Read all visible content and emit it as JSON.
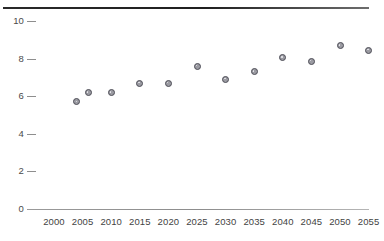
{
  "chart_data": {
    "type": "scatter",
    "title": "",
    "subtitle": "",
    "xlabel": "",
    "ylabel": "",
    "x": [
      2000,
      2005,
      2010,
      2015,
      2020,
      2025,
      2030,
      2035,
      2040,
      2045,
      2050,
      2055
    ],
    "categories": [
      "2000",
      "2005",
      "2010",
      "2015",
      "2020",
      "2025",
      "2030",
      "2035",
      "2040",
      "2045",
      "2050",
      "2055"
    ],
    "xlim": [
      2000,
      2055
    ],
    "ylim": [
      0,
      10
    ],
    "yticks": [
      0,
      2,
      4,
      6,
      8,
      10
    ],
    "ytick_labels": [
      "0",
      "2",
      "4",
      "6",
      "8",
      "10"
    ],
    "xticks": [
      2000,
      2005,
      2010,
      2015,
      2020,
      2025,
      2030,
      2035,
      2040,
      2045,
      2050,
      2055
    ],
    "xtick_labels": [
      "2000",
      "2005",
      "2010",
      "2015",
      "2020",
      "2025",
      "2030",
      "2035",
      "2040",
      "2045",
      "2050",
      "2055"
    ],
    "grid": false,
    "legend": false,
    "legend_position": "none",
    "series": [
      {
        "name": "series-1",
        "marker": "circle",
        "marker_fill": "#9b9ba2",
        "marker_edge": "#4e4e57",
        "points": [
          {
            "x": 2004,
            "y": 5.7
          },
          {
            "x": 2006,
            "y": 6.2
          },
          {
            "x": 2010,
            "y": 6.2
          },
          {
            "x": 2015,
            "y": 6.7
          },
          {
            "x": 2020,
            "y": 6.7
          },
          {
            "x": 2025,
            "y": 7.6
          },
          {
            "x": 2030,
            "y": 6.9
          },
          {
            "x": 2035,
            "y": 7.3
          },
          {
            "x": 2040,
            "y": 8.05
          },
          {
            "x": 2045,
            "y": 7.85
          },
          {
            "x": 2050,
            "y": 8.7
          },
          {
            "x": 2055,
            "y": 8.45
          }
        ],
        "values": [
          5.7,
          6.2,
          6.2,
          6.7,
          6.7,
          7.6,
          6.9,
          7.3,
          8.05,
          7.85,
          8.7,
          8.45
        ]
      }
    ],
    "colors": {
      "top_rule": "#1f1f1f",
      "axis_line": "#8d8d8d",
      "tick_label": "#434343",
      "marker_fill": "#9b9ba2",
      "marker_edge": "#4e4e57",
      "background": "#ffffff"
    }
  },
  "geometry": {
    "plot_left": 27,
    "plot_right": 369,
    "plot_top": 21,
    "plot_bottom": 209,
    "x_first_tick": 54,
    "x_tick_spacing": 28.6
  }
}
